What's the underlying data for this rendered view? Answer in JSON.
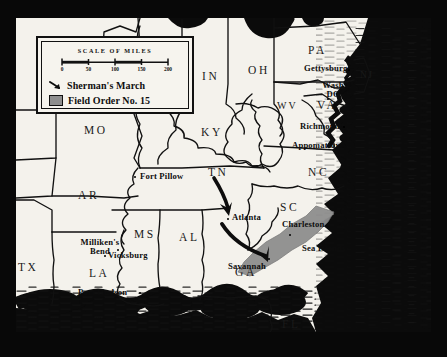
{
  "map": {
    "title": "Sherman's March and Field Order No. 15",
    "background_color": "#f4f2ec",
    "frame_color": "#080808",
    "ink_color": "#111111",
    "field_order_color": "#8e8e8e"
  },
  "legend": {
    "scale_title": "SCALE OF MILES",
    "scale_ticks": [
      "0",
      "50",
      "100",
      "150",
      "200"
    ],
    "entries": [
      {
        "symbol": "arrow-icon",
        "label": "Sherman's March"
      },
      {
        "symbol": "gray-swatch-icon",
        "label": "Field Order No. 15"
      }
    ]
  },
  "states": [
    {
      "abbr": "MO",
      "x": 68,
      "y": 106
    },
    {
      "abbr": "IL",
      "x": 140,
      "y": 52
    },
    {
      "abbr": "IN",
      "x": 186,
      "y": 52
    },
    {
      "abbr": "OH",
      "x": 232,
      "y": 46
    },
    {
      "abbr": "PA",
      "x": 292,
      "y": 26
    },
    {
      "abbr": "NJ",
      "x": 344,
      "y": 52
    },
    {
      "abbr": "WV",
      "x": 261,
      "y": 82
    },
    {
      "abbr": "VA",
      "x": 301,
      "y": 81
    },
    {
      "abbr": "KY",
      "x": 185,
      "y": 108
    },
    {
      "abbr": "TN",
      "x": 192,
      "y": 148
    },
    {
      "abbr": "NC",
      "x": 292,
      "y": 148
    },
    {
      "abbr": "SC",
      "x": 264,
      "y": 183
    },
    {
      "abbr": "GA",
      "x": 219,
      "y": 248
    },
    {
      "abbr": "FL",
      "x": 266,
      "y": 306
    },
    {
      "abbr": "AR",
      "x": 62,
      "y": 171
    },
    {
      "abbr": "MS",
      "x": 118,
      "y": 210
    },
    {
      "abbr": "AL",
      "x": 163,
      "y": 213
    },
    {
      "abbr": "LA",
      "x": 73,
      "y": 249
    },
    {
      "abbr": "TX",
      "x": 4,
      "y": 243
    }
  ],
  "cities": [
    {
      "name": "Fort Pillow",
      "x": 124,
      "y": 155,
      "dx": 118,
      "dy": 158,
      "lines": 1
    },
    {
      "name": "Milliken's\nBend",
      "x": 64,
      "y": 224,
      "dx": 101,
      "dy": 231,
      "lines": 2
    },
    {
      "name": "Vicksburg",
      "x": 92,
      "y": 233,
      "dx": 88,
      "dy": 237,
      "lines": 1
    },
    {
      "name": "Port Hudson",
      "x": 62,
      "y": 272,
      "dx": 123,
      "dy": 274,
      "lines": 1
    },
    {
      "name": "Atlanta",
      "x": 216,
      "y": 196,
      "dx": 211,
      "dy": 200,
      "lines": 1
    },
    {
      "name": "Savannah",
      "x": 253,
      "y": 240,
      "dx": 299,
      "dy": 240,
      "lines": 1
    },
    {
      "name": "Charleston",
      "x": 275,
      "y": 205,
      "dx": 273,
      "dy": 216,
      "lines": 1
    },
    {
      "name": "Sea Islands",
      "x": 292,
      "y": 228,
      "dx": 287,
      "dy": 234,
      "lines": 1
    },
    {
      "name": "Gettysburg",
      "x": 297,
      "y": 47,
      "dx": 346,
      "dy": 51,
      "lines": 1
    },
    {
      "name": "Wash\nDC",
      "x": 311,
      "y": 66,
      "dx": 322,
      "dy": 81,
      "lines": 2
    },
    {
      "name": "Richmond",
      "x": 291,
      "y": 104,
      "dx": 338,
      "dy": 108,
      "lines": 1
    },
    {
      "name": "Appomattox",
      "x": 282,
      "y": 124,
      "dx": 0,
      "dy": 0,
      "lines": 1
    }
  ]
}
